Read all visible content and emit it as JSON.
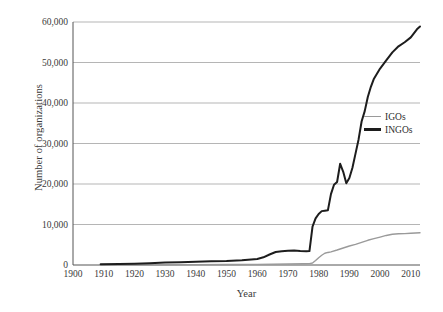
{
  "chart_data": {
    "type": "line",
    "title": "",
    "xlabel": "Year",
    "ylabel": "Number of organizations",
    "xlim": [
      1900,
      2013
    ],
    "ylim": [
      0,
      60000
    ],
    "grid": true,
    "legend_position": "right-middle",
    "xticks": [
      1900,
      1910,
      1920,
      1930,
      1940,
      1950,
      1960,
      1970,
      1980,
      1990,
      2000,
      2010
    ],
    "xtick_labels": [
      "1900",
      "1910",
      "1920",
      "1930",
      "1940",
      "1950",
      "1960",
      "1970",
      "1980",
      "1990",
      "2000",
      "2010"
    ],
    "yticks": [
      0,
      10000,
      20000,
      30000,
      40000,
      50000,
      60000
    ],
    "ytick_labels": [
      "0",
      "10,000",
      "20,000",
      "30,000",
      "40,000",
      "50,000",
      "60,000"
    ],
    "series": [
      {
        "name": "IGOs",
        "color": "#9a9a9a",
        "width": 1.4,
        "x": [
          1909,
          1920,
          1930,
          1940,
          1950,
          1960,
          1965,
          1970,
          1975,
          1977,
          1978,
          1979,
          1980,
          1981,
          1982,
          1983,
          1984,
          1986,
          1988,
          1990,
          1992,
          1994,
          1996,
          1998,
          2000,
          2002,
          2004,
          2006,
          2008,
          2010,
          2013
        ],
        "values": [
          40,
          60,
          80,
          90,
          120,
          160,
          200,
          250,
          300,
          350,
          500,
          1100,
          1800,
          2400,
          2900,
          3100,
          3250,
          3700,
          4200,
          4700,
          5100,
          5600,
          6100,
          6500,
          6900,
          7300,
          7600,
          7700,
          7750,
          7850,
          7950
        ]
      },
      {
        "name": "INGOs",
        "color": "#1d1d1d",
        "width": 2.0,
        "x": [
          1909,
          1915,
          1920,
          1925,
          1930,
          1935,
          1940,
          1945,
          1950,
          1955,
          1960,
          1962,
          1964,
          1966,
          1968,
          1970,
          1972,
          1974,
          1976,
          1977,
          1978,
          1979,
          1980,
          1981,
          1982,
          1983,
          1984,
          1985,
          1986,
          1987,
          1988,
          1989,
          1990,
          1991,
          1992,
          1993,
          1994,
          1995,
          1996,
          1997,
          1998,
          2000,
          2002,
          2004,
          2006,
          2008,
          2010,
          2012,
          2013
        ],
        "values": [
          180,
          250,
          330,
          450,
          600,
          700,
          800,
          900,
          1000,
          1200,
          1500,
          1900,
          2600,
          3200,
          3400,
          3500,
          3600,
          3450,
          3400,
          3450,
          9500,
          11500,
          12600,
          13300,
          13400,
          13500,
          17500,
          19800,
          20500,
          25000,
          23000,
          20200,
          21500,
          24000,
          27500,
          31000,
          35500,
          38000,
          41500,
          44000,
          46000,
          48500,
          50500,
          52500,
          54000,
          55000,
          56200,
          58200,
          58900
        ]
      }
    ]
  },
  "legend": {
    "items": [
      {
        "label": "IGOs",
        "color": "#9a9a9a"
      },
      {
        "label": "INGOs",
        "color": "#1d1d1d"
      }
    ]
  },
  "axes": {
    "y_title": "Number of organizations",
    "x_title": "Year"
  },
  "colors": {
    "grid": "#b5b5b5",
    "axis": "#555555",
    "background": "#ffffff",
    "text": "#3a3a3a"
  }
}
